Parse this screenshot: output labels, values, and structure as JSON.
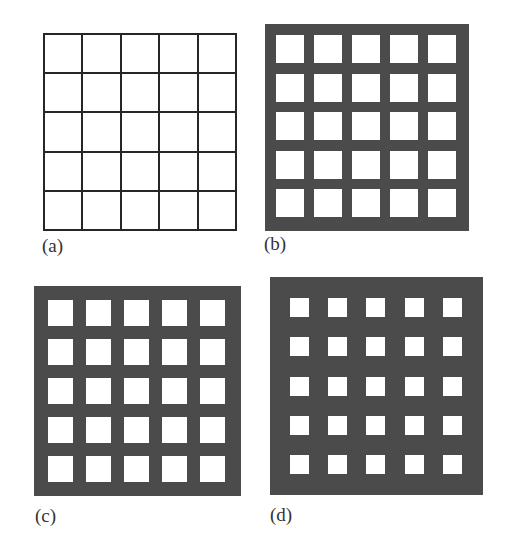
{
  "figure": {
    "panels": [
      {
        "id": "a",
        "label": "(a)",
        "style": "line-grid",
        "rows": 5,
        "cols": 5,
        "box": {
          "x": 43,
          "y": 33,
          "w": 194,
          "h": 198
        },
        "line_width": 2,
        "line_color": "#262626",
        "label_pos": {
          "x": 42,
          "y": 236
        }
      },
      {
        "id": "b",
        "label": "(b)",
        "style": "filled-frame",
        "rows": 5,
        "cols": 5,
        "box": {
          "x": 265,
          "y": 24,
          "w": 204,
          "h": 207
        },
        "fill_color": "#4b4b4b",
        "hole": {
          "x0": 276,
          "y0": 35,
          "w": 28,
          "h": 28,
          "step_x": 38,
          "step_y": 38.5
        },
        "label_pos": {
          "x": 264,
          "y": 234
        }
      },
      {
        "id": "c",
        "label": "(c)",
        "style": "filled-frame",
        "rows": 5,
        "cols": 5,
        "box": {
          "x": 34,
          "y": 286,
          "w": 207,
          "h": 210
        },
        "fill_color": "#4b4b4b",
        "hole": {
          "x0": 48,
          "y0": 300,
          "w": 25,
          "h": 26,
          "step_x": 38,
          "step_y": 39
        },
        "label_pos": {
          "x": 35,
          "y": 506
        }
      },
      {
        "id": "d",
        "label": "(d)",
        "style": "filled-frame",
        "rows": 5,
        "cols": 5,
        "box": {
          "x": 270,
          "y": 277,
          "w": 213,
          "h": 218
        },
        "fill_color": "#4b4b4b",
        "hole": {
          "x0": 290,
          "y0": 298,
          "w": 19,
          "h": 19,
          "step_x": 38.2,
          "step_y": 39.3
        },
        "label_pos": {
          "x": 270,
          "y": 505
        }
      }
    ]
  }
}
